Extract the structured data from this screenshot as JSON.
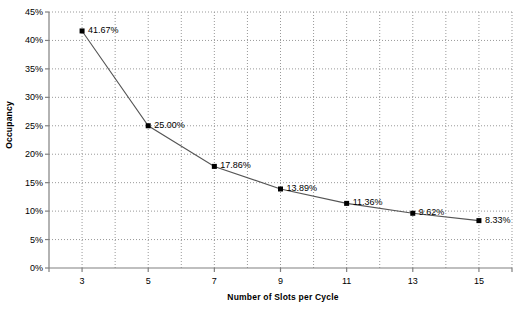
{
  "chart_data": {
    "type": "line",
    "title": "",
    "xlabel": "Number of Slots per Cycle",
    "ylabel": "Occupancy",
    "x": [
      3,
      5,
      7,
      9,
      11,
      13,
      15
    ],
    "values": [
      41.67,
      25.0,
      17.86,
      13.89,
      11.36,
      9.62,
      8.33
    ],
    "point_labels": [
      "41.67%",
      "25.00%",
      "17.86%",
      "13.89%",
      "11.36%",
      "9.62%",
      "8.33%"
    ],
    "xlim": [
      2,
      16
    ],
    "ylim": [
      0,
      45
    ],
    "xticks": [
      3,
      5,
      7,
      9,
      11,
      13,
      15
    ],
    "xtick_labels": [
      "3",
      "5",
      "7",
      "9",
      "11",
      "13",
      "15"
    ],
    "yticks": [
      0,
      5,
      10,
      15,
      20,
      25,
      30,
      35,
      40,
      45
    ],
    "ytick_labels": [
      "0%",
      "5%",
      "10%",
      "15%",
      "20%",
      "25%",
      "30%",
      "35%",
      "40%",
      "45%"
    ],
    "grid": {
      "x_gridlines_step": 1,
      "y_gridlines_step": 5,
      "style": "dotted",
      "color": "#999999"
    },
    "legend": {
      "visible": false,
      "entries": []
    },
    "series": [
      {
        "name": "Occupancy",
        "line_color": "#555555",
        "marker": "square",
        "marker_color": "#000000",
        "values": [
          41.67,
          25.0,
          17.86,
          13.89,
          11.36,
          9.62,
          8.33
        ]
      }
    ],
    "axis_color": "#808080",
    "background": "#ffffff"
  }
}
